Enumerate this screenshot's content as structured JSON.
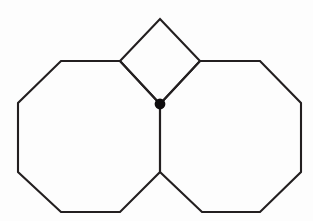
{
  "figure": {
    "background_color": "#fdfdfd",
    "stroke_color": "#231f20",
    "marker_color": "#0f0d0e",
    "stroke_width": 2.1,
    "canvas": {
      "width": 313,
      "height": 221
    }
  },
  "chart_data": {
    "type": "diagram",
    "xlabel": "",
    "ylabel": "",
    "xlim": [
      0,
      313
    ],
    "ylim": [
      0,
      221
    ],
    "grid": false,
    "legend": "none",
    "shapes": [
      {
        "name": "left-octagon",
        "kind": "polygon",
        "sides": 8,
        "closed": true,
        "points": [
          [
            120,
            61
          ],
          [
            61,
            61
          ],
          [
            18,
            103
          ],
          [
            18,
            172
          ],
          [
            61,
            212
          ],
          [
            120,
            212
          ],
          [
            160,
            172
          ],
          [
            160,
            104
          ]
        ],
        "points_str": "120,61 61,61 18,103 18,172 61,212 120,212 160,172 160,104"
      },
      {
        "name": "right-octagon",
        "kind": "polygon",
        "sides": 8,
        "closed": true,
        "points": [
          [
            200,
            61
          ],
          [
            260,
            61
          ],
          [
            301,
            103
          ],
          [
            301,
            172
          ],
          [
            260,
            212
          ],
          [
            202,
            212
          ],
          [
            160,
            172
          ],
          [
            160,
            104
          ]
        ],
        "points_str": "200,61 260,61 301,103 301,172 260,212 202,212 160,172 160,104"
      },
      {
        "name": "top-square",
        "kind": "polygon",
        "sides": 4,
        "closed": true,
        "orientation": "diamond",
        "points": [
          [
            160,
            19
          ],
          [
            200,
            61
          ],
          [
            160,
            104
          ],
          [
            120,
            61
          ]
        ],
        "points_str": "160,19 200,61 160,104 120,61"
      }
    ],
    "markers": [
      {
        "name": "shared-vertex-dot",
        "kind": "filled-circle",
        "x": 160,
        "y": 104,
        "radius": 5.4
      }
    ],
    "annotations": []
  }
}
